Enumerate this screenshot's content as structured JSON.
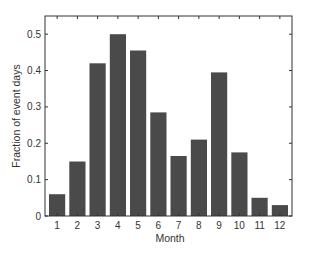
{
  "chart_data": {
    "type": "bar",
    "title": "",
    "xlabel": "Month",
    "ylabel": "Fraction of event days",
    "categories": [
      "1",
      "2",
      "3",
      "4",
      "5",
      "6",
      "7",
      "8",
      "9",
      "10",
      "11",
      "12"
    ],
    "values": [
      0.06,
      0.15,
      0.42,
      0.5,
      0.455,
      0.285,
      0.165,
      0.21,
      0.395,
      0.175,
      0.05,
      0.03
    ],
    "ylim": [
      0,
      0.55
    ],
    "xlim": [
      0.4,
      12.6
    ],
    "yticks": [
      0,
      0.1,
      0.2,
      0.3,
      0.4,
      0.5
    ],
    "ytick_labels": [
      "0",
      "0.1",
      "0.2",
      "0.3",
      "0.4",
      "0.5"
    ],
    "grid": false,
    "legend": null,
    "bar_color": "#4a4a4a",
    "axes_color": "#333333"
  }
}
